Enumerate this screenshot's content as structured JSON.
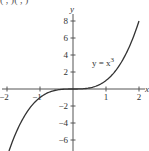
{
  "header_fragment": "(  ,  )(  ,  )",
  "chart_data": {
    "type": "line",
    "title": "",
    "xlabel": "x",
    "ylabel": "y",
    "xlim": [
      -2,
      2
    ],
    "ylim": [
      -7.3,
      8.2
    ],
    "grid": false,
    "x_ticks": [
      -2,
      -1,
      1,
      2
    ],
    "x_tick_labels": [
      "−2",
      "−1",
      "1",
      "2"
    ],
    "y_ticks": [
      8,
      6,
      4,
      2,
      -2,
      -4,
      -6
    ],
    "y_tick_labels": [
      "8",
      "6",
      "4",
      "2",
      "−2",
      "−4",
      "−6"
    ],
    "series": [
      {
        "name": "y = x^3",
        "label_text": "y = x",
        "label_superscript": "3",
        "x": [
          -1.94,
          -1.75,
          -1.5,
          -1.25,
          -1,
          -0.75,
          -0.5,
          -0.25,
          0,
          0.25,
          0.5,
          0.75,
          1,
          1.25,
          1.5,
          1.75,
          2
        ],
        "values": [
          -7.3,
          -5.36,
          -3.375,
          -1.95,
          -1,
          -0.42,
          -0.125,
          -0.016,
          0,
          0.016,
          0.125,
          0.42,
          1,
          1.95,
          3.375,
          5.36,
          8
        ],
        "color": "#333333"
      }
    ],
    "annotations": [
      {
        "text": "y = x³",
        "x": 0.75,
        "y": 3
      }
    ]
  }
}
